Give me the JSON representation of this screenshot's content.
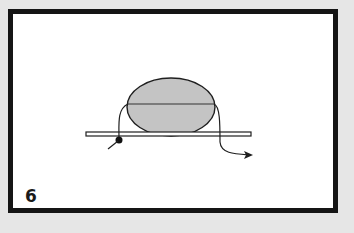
{
  "diagram": {
    "step_number": "6",
    "elements": {
      "ellipse": {
        "fill": "#c4c4c4",
        "stroke": "#1f1f1f",
        "description": "oval object sitting on bar, divided by horizontal midline"
      },
      "bar": {
        "fill": "#ffffff",
        "stroke": "#1f1f1f",
        "description": "horizontal flat bar"
      },
      "cord": {
        "stroke": "#1f1f1f",
        "description": "line wrapping over the oval from a knot on the left, exiting right with an arrowhead"
      },
      "knot": {
        "fill": "#111111",
        "description": "black dot at the start of the cord"
      }
    }
  }
}
